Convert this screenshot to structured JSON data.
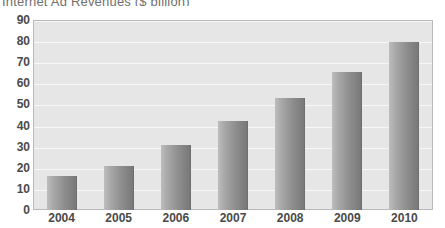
{
  "chart_data": {
    "type": "bar",
    "title": "Internet Ad Revenues ($ billion)",
    "xlabel": "",
    "ylabel": "",
    "categories": [
      "2004",
      "2005",
      "2006",
      "2007",
      "2008",
      "2009",
      "2010"
    ],
    "values": [
      16,
      21,
      31,
      42,
      53,
      65.5,
      79.5
    ],
    "ylim": [
      0,
      90
    ],
    "yticks": [
      0,
      10,
      20,
      30,
      40,
      50,
      60,
      70,
      80,
      90
    ],
    "ytick_labels": [
      "0",
      "10",
      "20",
      "30",
      "40",
      "50",
      "60",
      "70",
      "80",
      "90"
    ],
    "grid": true,
    "grid_axis": "y",
    "legend": false,
    "legend_position": "none",
    "series": [
      {
        "name": "Internet Ad Revenues",
        "values": [
          16,
          21,
          31,
          42,
          53,
          65.5,
          79.5
        ]
      }
    ],
    "bar_fill_gradient": [
      "#bdbdbd",
      "#787878"
    ],
    "plot_background": "#e6e6e6",
    "axis_text_color": "#4a4a4a",
    "title_color": "#6f6f6f",
    "annotations": []
  }
}
